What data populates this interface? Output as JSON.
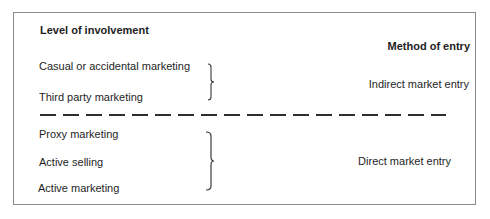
{
  "headers": {
    "left": "Level of involvement",
    "right": "Method of entry"
  },
  "groups": [
    {
      "items": [
        "Casual or accidental marketing",
        "Third party marketing"
      ],
      "method": "Indirect market entry"
    },
    {
      "items": [
        "Proxy marketing",
        "Active selling",
        "Active marketing"
      ],
      "method": "Direct market entry"
    }
  ],
  "colors": {
    "line": "#3a3a3a",
    "frame": "#8a8a8a",
    "text": "#1e1e1e"
  }
}
